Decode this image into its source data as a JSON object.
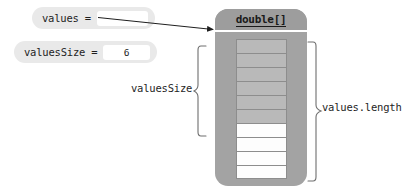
{
  "diagram": {
    "variables": [
      {
        "name": "values-variable",
        "label": "values =",
        "value": ""
      },
      {
        "name": "valuesSize-variable",
        "label": "valuesSize =",
        "value": "6"
      }
    ],
    "object": {
      "type_label": "double[]",
      "capacity": 10,
      "used_count": 6,
      "cells": [
        {
          "index": 0,
          "state": "used",
          "value": ""
        },
        {
          "index": 1,
          "state": "used",
          "value": ""
        },
        {
          "index": 2,
          "state": "used",
          "value": ""
        },
        {
          "index": 3,
          "state": "used",
          "value": ""
        },
        {
          "index": 4,
          "state": "used",
          "value": ""
        },
        {
          "index": 5,
          "state": "used",
          "value": ""
        },
        {
          "index": 6,
          "state": "empty",
          "value": ""
        },
        {
          "index": 7,
          "state": "empty",
          "value": ""
        },
        {
          "index": 8,
          "state": "empty",
          "value": ""
        },
        {
          "index": 9,
          "state": "empty",
          "value": ""
        }
      ]
    },
    "annotations": [
      {
        "name": "valuesSize-brace",
        "label": "valuesSize",
        "side": "left"
      },
      {
        "name": "valuesLength-brace",
        "label": "values.length",
        "side": "right"
      }
    ],
    "pointer": {
      "name": "values-reference-arrow",
      "from": "values-variable",
      "to": "double-array-object"
    },
    "colors": {
      "pill_background": "#e9e9e9",
      "slot_background": "#ffffff",
      "object_body": "#a3a3a3",
      "object_header": "#9d9d9d",
      "cell_used": "#b9b9b9",
      "cell_empty": "#fdfdfd",
      "ink": "#1f1f1f"
    }
  }
}
